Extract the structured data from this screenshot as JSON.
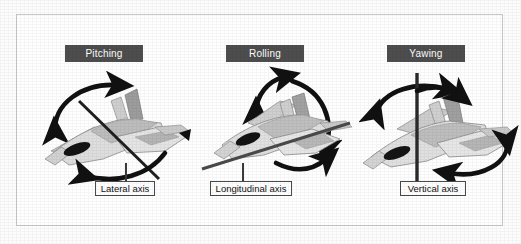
{
  "figure": {
    "background_color": "#ffffff",
    "frame_color": "#c9c9c9"
  },
  "style": {
    "title_bar_background": "#4e4e4e",
    "title_bar_text_color": "#ffffff",
    "arrow_color": "#111111",
    "axis_line_color": "#1a1a1a",
    "aircraft_light": "#dcdcdc",
    "aircraft_mid": "#9d9d9d",
    "aircraft_dark": "#6f6f6f",
    "canopy_color": "#111111",
    "label_border_color": "#4a4a4a",
    "label_text_color": "#111111"
  },
  "panels": [
    {
      "id": "pitching",
      "title": "Pitching",
      "axis_label": "Lateral axis",
      "axis_orientation": "diagonal-wing-to-wing",
      "rotation": "pitch"
    },
    {
      "id": "rolling",
      "title": "Rolling",
      "axis_label": "Longitudinal axis",
      "axis_orientation": "nose-to-tail",
      "rotation": "roll"
    },
    {
      "id": "yawing",
      "title": "Yawing",
      "axis_label": "Vertical axis",
      "axis_orientation": "vertical-through-fuselage",
      "rotation": "yaw"
    }
  ]
}
